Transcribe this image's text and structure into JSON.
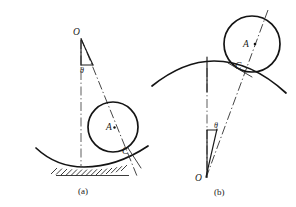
{
  "figure": {
    "background_color": "#ffffff",
    "ink_color": "#141414",
    "centerline_color": "#555555",
    "panels": [
      {
        "id": "a",
        "caption": "(a)",
        "caption_pos": {
          "x": 85,
          "y": 193
        },
        "description": "Disk resting in a concave (valley) surface with hatching beneath; pivot O above.",
        "labels": [
          {
            "name": "O",
            "text": "O",
            "x": 73,
            "y": 35
          },
          {
            "name": "theta",
            "text": "θ",
            "x": 80,
            "y": 73
          },
          {
            "name": "A",
            "text": "A",
            "x": 108,
            "y": 128
          },
          {
            "name": "C",
            "text": "C",
            "x": 124,
            "y": 151
          }
        ],
        "points": {
          "O": {
            "x": 81,
            "y": 38
          },
          "A": {
            "x": 113,
            "y": 127
          },
          "C": {
            "x": 122,
            "y": 155
          }
        },
        "circle": {
          "cx": 113,
          "cy": 127,
          "r": 25
        },
        "vertical_centerline": {
          "x": 81,
          "y1": 38,
          "y2": 167
        },
        "slant_centerline": {
          "x1": 81,
          "y1": 38,
          "x2": 136,
          "y2": 174
        },
        "triangle_base": {
          "x1": 81,
          "y1": 65,
          "x2": 93,
          "y2": 65
        },
        "surface": "concave",
        "hatching": true
      },
      {
        "id": "b",
        "caption": "(b)",
        "caption_pos": {
          "x": 222,
          "y": 194
        },
        "description": "Disk resting on top of a convex (hill) surface; pivot O below.",
        "labels": [
          {
            "name": "A",
            "text": "A",
            "x": 244,
            "y": 46
          },
          {
            "name": "C",
            "text": "C",
            "x": 238,
            "y": 66
          },
          {
            "name": "theta",
            "text": "θ",
            "x": 217,
            "y": 131
          },
          {
            "name": "O",
            "text": "O",
            "x": 198,
            "y": 180
          }
        ],
        "points": {
          "O": {
            "x": 207,
            "y": 177
          },
          "A": {
            "x": 252,
            "y": 44
          },
          "C": {
            "x": 245,
            "y": 70
          }
        },
        "circle": {
          "cx": 252,
          "cy": 44,
          "r": 28
        },
        "vertical_centerline": {
          "x": 207,
          "y1": 58,
          "y2": 177
        },
        "slant_centerline": {
          "x1": 207,
          "y1": 177,
          "x2": 266,
          "y2": 12
        },
        "triangle_base": {
          "x1": 207,
          "y1": 130,
          "x2": 217,
          "y2": 130
        },
        "surface": "convex",
        "hatching": false
      }
    ]
  }
}
